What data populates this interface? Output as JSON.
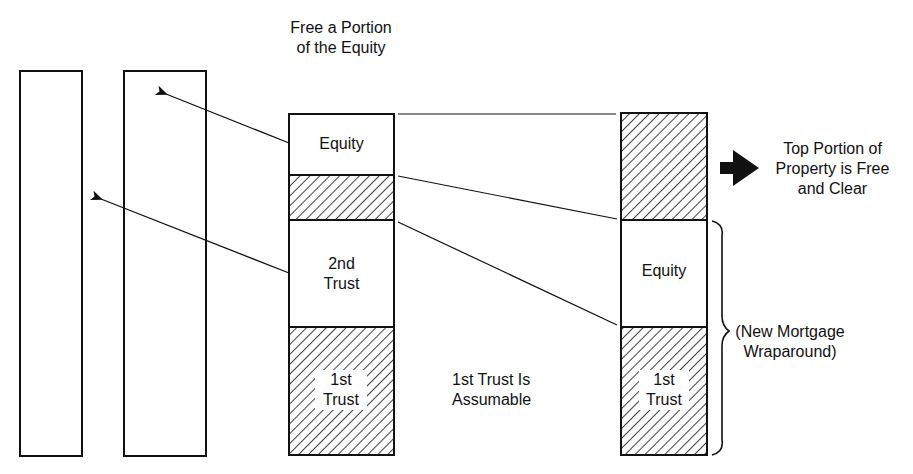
{
  "diagram": {
    "title_lines": [
      "Free a Portion",
      "of the Equity"
    ],
    "center_column": {
      "segments": [
        {
          "label": "Equity",
          "fill": "white"
        },
        {
          "label": "",
          "fill": "hatched"
        },
        {
          "label_lines": [
            "2nd",
            "Trust"
          ],
          "fill": "white"
        },
        {
          "label_lines": [
            "1st",
            "Trust"
          ],
          "fill": "hatched"
        }
      ]
    },
    "middle_note_lines": [
      "1st Trust Is",
      "Assumable"
    ],
    "right_column": {
      "segments": [
        {
          "label": "",
          "fill": "hatched"
        },
        {
          "label": "Equity",
          "fill": "white"
        },
        {
          "label_lines": [
            "1st",
            "Trust"
          ],
          "fill": "hatched"
        }
      ]
    },
    "callout_top_lines": [
      "Top Portion of",
      "Property is Free",
      "and Clear"
    ],
    "callout_brace_lines": [
      "(New Mortgage",
      "Wraparound)"
    ],
    "empty_columns": 2,
    "colors": {
      "ink": "#111111",
      "background": "#ffffff"
    }
  }
}
